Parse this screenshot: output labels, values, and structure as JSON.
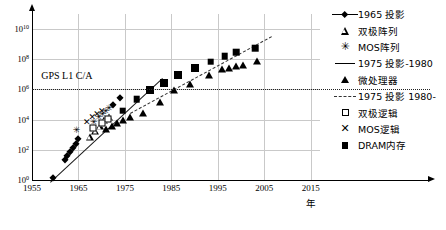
{
  "chart_data": {
    "type": "scatter",
    "title": "",
    "xlabel": "年",
    "ylabel": "",
    "xlim": [
      1955,
      2017
    ],
    "ylim": [
      0,
      11
    ],
    "grid": true,
    "legend_position": "right",
    "x_ticks": [
      "1955",
      "1965",
      "1975",
      "1985",
      "1995",
      "2005",
      "2015"
    ],
    "x_tick_values": [
      1955,
      1965,
      1975,
      1985,
      1995,
      2005,
      2015
    ],
    "y_ticks": [
      "10<sup>0</sup>",
      "10<sup>2</sup>",
      "10<sup>4</sup>",
      "10<sup>6</sup>",
      "10<sup>8</sup>",
      "10<sup>10</sup>"
    ],
    "y_tick_exponents": [
      0,
      2,
      4,
      6,
      8,
      10
    ],
    "annotations": [
      {
        "text": "GPS L1 C/A",
        "x": 1962.5,
        "y_exp": 6.55
      }
    ],
    "threshold_line": {
      "label": "GPS L1 C/A",
      "y_exp": 6.0,
      "style": "dotted"
    },
    "series": [
      {
        "name": "1965 投影",
        "marker": "filled-diamond",
        "points": [
          {
            "x": 1959.5,
            "y_exp": 0.15
          },
          {
            "x": 1962.0,
            "y_exp": 1.35
          },
          {
            "x": 1962.6,
            "y_exp": 1.6
          },
          {
            "x": 1963.2,
            "y_exp": 1.85
          },
          {
            "x": 1963.8,
            "y_exp": 2.1
          },
          {
            "x": 1964.4,
            "y_exp": 2.4
          },
          {
            "x": 1965.0,
            "y_exp": 2.7
          },
          {
            "x": 1972.5,
            "y_exp": 5.0
          },
          {
            "x": 1974.0,
            "y_exp": 5.45
          }
        ]
      },
      {
        "name": "双极阵列",
        "marker": "open-triangle",
        "points": [
          {
            "x": 1967.4,
            "y_exp": 2.85
          },
          {
            "x": 1968.6,
            "y_exp": 3.25
          },
          {
            "x": 1969.6,
            "y_exp": 3.55
          },
          {
            "x": 1970.6,
            "y_exp": 3.95
          },
          {
            "x": 1971.6,
            "y_exp": 4.2
          }
        ]
      },
      {
        "name": "MOS阵列",
        "marker": "asterisk",
        "points": [
          {
            "x": 1964.6,
            "y_exp": 3.3
          },
          {
            "x": 1968.3,
            "y_exp": 3.85
          },
          {
            "x": 1969.4,
            "y_exp": 4.15
          },
          {
            "x": 1970.2,
            "y_exp": 4.35
          },
          {
            "x": 1970.9,
            "y_exp": 4.55
          },
          {
            "x": 1971.6,
            "y_exp": 4.75
          }
        ]
      },
      {
        "name": "微处理器",
        "marker": "filled-triangle",
        "points": [
          {
            "x": 1971.0,
            "y_exp": 3.4
          },
          {
            "x": 1972.2,
            "y_exp": 3.55
          },
          {
            "x": 1973.4,
            "y_exp": 3.75
          },
          {
            "x": 1974.6,
            "y_exp": 3.95
          },
          {
            "x": 1976.0,
            "y_exp": 4.15
          },
          {
            "x": 1979.0,
            "y_exp": 4.45
          },
          {
            "x": 1982.5,
            "y_exp": 5.2
          },
          {
            "x": 1985.5,
            "y_exp": 5.95
          },
          {
            "x": 1989.0,
            "y_exp": 6.35
          },
          {
            "x": 1993.0,
            "y_exp": 6.95
          },
          {
            "x": 1996.0,
            "y_exp": 7.35
          },
          {
            "x": 1997.5,
            "y_exp": 7.45
          },
          {
            "x": 1999.0,
            "y_exp": 7.55
          },
          {
            "x": 2000.5,
            "y_exp": 7.62
          },
          {
            "x": 2003.5,
            "y_exp": 7.9
          }
        ]
      },
      {
        "name": "双极逻辑",
        "marker": "open-square",
        "points": [
          {
            "x": 1968.2,
            "y_exp": 3.45
          },
          {
            "x": 1970.0,
            "y_exp": 3.8
          },
          {
            "x": 1971.3,
            "y_exp": 4.05
          }
        ]
      },
      {
        "name": "MOS逻辑",
        "marker": "cross",
        "points": [
          {
            "x": 1966.8,
            "y_exp": 3.85
          },
          {
            "x": 1968.0,
            "y_exp": 4.15
          },
          {
            "x": 1969.0,
            "y_exp": 4.35
          },
          {
            "x": 1970.0,
            "y_exp": 4.55
          }
        ]
      },
      {
        "name": "DRAM内存",
        "marker": "filled-square",
        "points": [
          {
            "x": 1974.5,
            "y_exp": 4.6
          },
          {
            "x": 1977.5,
            "y_exp": 5.35
          },
          {
            "x": 1980.5,
            "y_exp": 5.95
          },
          {
            "x": 1983.5,
            "y_exp": 6.4
          },
          {
            "x": 1986.5,
            "y_exp": 6.95
          },
          {
            "x": 1990.0,
            "y_exp": 7.45
          },
          {
            "x": 1993.5,
            "y_exp": 7.85
          },
          {
            "x": 1996.5,
            "y_exp": 8.2
          },
          {
            "x": 1999.0,
            "y_exp": 8.45
          },
          {
            "x": 2003.0,
            "y_exp": 8.75
          }
        ]
      }
    ],
    "trend_lines": [
      {
        "name": "1975 投影-1980",
        "style": "solid",
        "x0": 1958.8,
        "y0_exp": -0.15,
        "x1": 1983.0,
        "y1_exp": 6.75
      },
      {
        "name": "1975 投影 1980-",
        "style": "dashed",
        "x0": 1976.0,
        "y0_exp": 4.45,
        "x1": 2006.5,
        "y1_exp": 9.55
      }
    ]
  },
  "legend": {
    "items": [
      {
        "label": "1965 投影",
        "symbol": "line-diamond"
      },
      {
        "label": "双极阵列",
        "symbol": "open-triangle"
      },
      {
        "label": "MOS阵列",
        "symbol": "asterisk"
      },
      {
        "label": "1975 投影-1980",
        "symbol": "solid-line"
      },
      {
        "label": "微处理器",
        "symbol": "filled-triangle"
      },
      {
        "label": "1975 投影 1980-",
        "symbol": "dashed-line"
      },
      {
        "label": "双极逻辑",
        "symbol": "open-square"
      },
      {
        "label": "MOS逻辑",
        "symbol": "cross"
      },
      {
        "label": "DRAM内存",
        "symbol": "filled-square"
      }
    ]
  }
}
